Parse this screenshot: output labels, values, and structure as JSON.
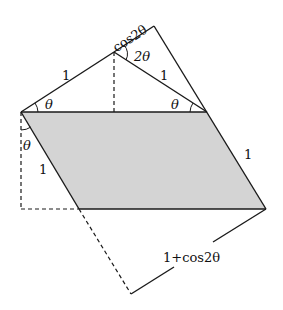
{
  "diagram": {
    "colors": {
      "stroke": "#1a1a1a",
      "fill_parallelogram": "#d4d4d4",
      "background": "#ffffff"
    },
    "labels": {
      "top_left_side": "1",
      "top_right_side": "1",
      "top_edge": "cos2θ",
      "apex_angle": "2θ",
      "left_base_angle": "θ",
      "right_base_angle": "θ",
      "left_vertical_angle": "θ",
      "parallelogram_left_side": "1",
      "parallelogram_right_side": "1",
      "bottom_diagonal": "1+cos2θ"
    }
  }
}
